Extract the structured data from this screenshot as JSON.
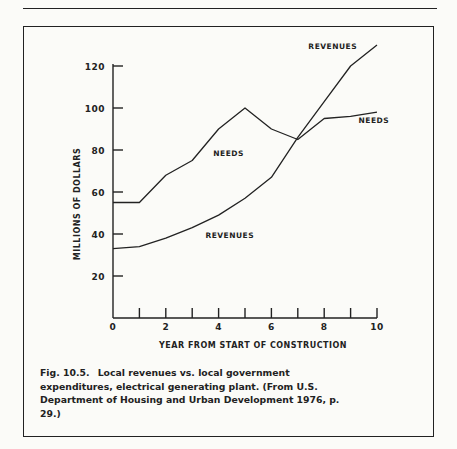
{
  "page": {
    "header_left": "",
    "header_right": ""
  },
  "caption": {
    "figure_label": "Fig. 10.5.",
    "text": "Local revenues vs. local government expenditures, electrical generating plant. (From U.S. Department of Housing and Urban Development 1976, p. 29.)"
  },
  "chart_data": {
    "type": "line",
    "title": "",
    "xlabel": "YEAR FROM START OF CONSTRUCTION",
    "ylabel": "MILLIONS OF DOLLARS",
    "x": [
      0,
      1,
      2,
      3,
      4,
      5,
      6,
      7,
      8,
      9,
      10
    ],
    "xlim": [
      0,
      10
    ],
    "ylim": [
      0,
      120
    ],
    "x_ticks": [
      0,
      1,
      2,
      3,
      4,
      5,
      6,
      7,
      8,
      9,
      10
    ],
    "x_tick_labels": [
      "0",
      "2",
      "4",
      "6",
      "8",
      "10"
    ],
    "y_ticks": [
      20,
      40,
      60,
      80,
      100,
      120
    ],
    "y_tick_labels": [
      "20",
      "40",
      "60",
      "80",
      "100",
      "120"
    ],
    "grid": false,
    "legend": "inline labels",
    "series": [
      {
        "name": "NEEDS",
        "values": [
          55,
          55,
          68,
          75,
          90,
          100,
          90,
          85,
          95,
          96,
          98
        ]
      },
      {
        "name": "REVENUES",
        "values": [
          33,
          34,
          38,
          43,
          49,
          57,
          67,
          86,
          103,
          120,
          130
        ]
      }
    ],
    "annotations": [
      {
        "text": "NEEDS",
        "x": 3.8,
        "y": 77
      },
      {
        "text": "NEEDS",
        "x": 9.3,
        "y": 93
      },
      {
        "text": "REVENUES",
        "x": 3.5,
        "y": 38
      },
      {
        "text": "REVENUES",
        "x": 7.4,
        "y": 128
      }
    ]
  }
}
